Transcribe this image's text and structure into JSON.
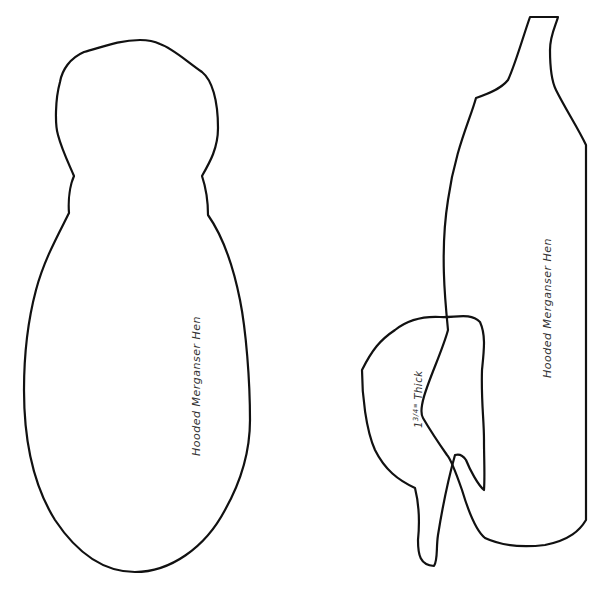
{
  "pattern": {
    "top_view": {
      "label": "Hooded Merganser Hen",
      "stroke_color": "#111111"
    },
    "side_view": {
      "label": "Hooded Merganser Hen",
      "stroke_color": "#111111"
    },
    "head_piece": {
      "thickness_whole": "1",
      "thickness_fraction": "3/4",
      "thickness_unit": "\"",
      "thickness_suffix": " Thick"
    },
    "background_color": "#ffffff"
  }
}
